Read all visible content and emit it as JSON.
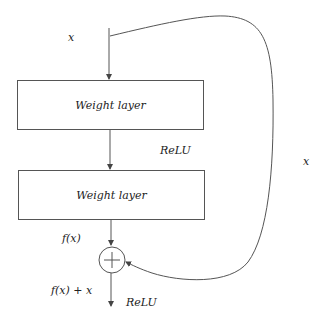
{
  "diagram": {
    "input_label": "x",
    "layer1_label": "Weight layer",
    "activation1_label": "ReLU",
    "layer2_label": "Weight layer",
    "fx_label": "f(x)",
    "sum_label": "f(x) + x",
    "activation2_label": "ReLU",
    "skip_label": "x",
    "add_symbol": "+"
  },
  "colors": {
    "stroke": "#555555",
    "text": "#222222",
    "background": "#ffffff"
  }
}
